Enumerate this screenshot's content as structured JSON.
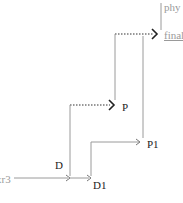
{
  "diagram": {
    "nodes": [
      {
        "id": "phy",
        "label": "phy"
      },
      {
        "id": "final",
        "label": "final"
      },
      {
        "id": "P",
        "label": "P"
      },
      {
        "id": "P1",
        "label": "P1"
      },
      {
        "id": "D",
        "label": "D"
      },
      {
        "id": "D1",
        "label": "D1"
      },
      {
        "id": "xr3",
        "label": "xr3"
      }
    ],
    "edges": [
      {
        "from": "xr3",
        "to": "D",
        "style": "solid"
      },
      {
        "from": "D",
        "to": "D1",
        "style": "solid"
      },
      {
        "from": "D",
        "to": "P",
        "style": "dotted"
      },
      {
        "from": "D1",
        "to": "P1",
        "style": "solid"
      },
      {
        "from": "P",
        "to": "final",
        "style": "dotted"
      },
      {
        "from": "P1",
        "to": "final",
        "style": "solid"
      },
      {
        "from": "final",
        "to": "phy",
        "style": "solid"
      }
    ],
    "caption": "",
    "colors": {
      "line": "#9a9a9a",
      "dotted": "#333333",
      "arrow_bold": "#222222",
      "text": "#222222",
      "faint_text": "#9a9a9a"
    }
  }
}
